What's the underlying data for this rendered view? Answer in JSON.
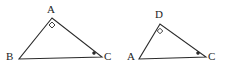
{
  "figure": {
    "background_color": "#ffffff",
    "stroke_color": "#2b2b2b",
    "label_color": "#1d1d1d",
    "stroke_width": 1.1,
    "width": 227,
    "height": 70
  },
  "triangles": [
    {
      "id": "triangle-left",
      "name": "triangle-abc",
      "vertices": [
        {
          "label": "A",
          "x": 52,
          "y": 18,
          "label_x": 47,
          "label_y": 4
        },
        {
          "label": "B",
          "x": 19,
          "y": 59,
          "label_x": 6,
          "label_y": 51
        },
        {
          "label": "C",
          "x": 102,
          "y": 57,
          "label_x": 104,
          "label_y": 51
        }
      ],
      "markers": [
        {
          "type": "right-angle-square",
          "name": "right-angle-marker-a",
          "vertex": "A",
          "cx": 52,
          "cy": 25,
          "size": 6,
          "filled": false
        },
        {
          "type": "angle-dot",
          "name": "angle-dot-marker-c",
          "vertex": "C",
          "cx": 94,
          "cy": 53,
          "radius": 1.5,
          "filled": true
        }
      ]
    },
    {
      "id": "triangle-right",
      "name": "triangle-adc",
      "vertices": [
        {
          "label": "D",
          "x": 160,
          "y": 24,
          "label_x": 155,
          "label_y": 9
        },
        {
          "label": "A",
          "x": 139,
          "y": 59,
          "label_x": 127,
          "label_y": 51
        },
        {
          "label": "C",
          "x": 206,
          "y": 57,
          "label_x": 208,
          "label_y": 51
        }
      ],
      "markers": [
        {
          "type": "right-angle-square",
          "name": "right-angle-marker-d",
          "vertex": "D",
          "cx": 160,
          "cy": 31,
          "size": 5.5,
          "filled": false
        },
        {
          "type": "angle-dot",
          "name": "angle-dot-marker-c",
          "vertex": "C",
          "cx": 198,
          "cy": 53,
          "radius": 1.5,
          "filled": true
        }
      ]
    }
  ]
}
